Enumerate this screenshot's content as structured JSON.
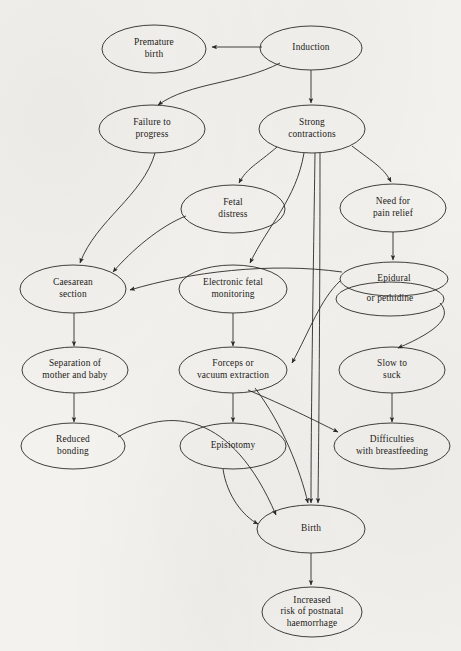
{
  "diagram": {
    "background_color": "#f4f2ee",
    "stroke_color": "#2b2a28",
    "text_color": "#1d1c1a",
    "nodes": [
      {
        "id": "premature_birth",
        "lines": [
          "Premature",
          "birth"
        ],
        "cx": 154,
        "cy": 49,
        "rx": 52,
        "ry": 24
      },
      {
        "id": "induction",
        "lines": [
          "Induction"
        ],
        "cx": 311,
        "cy": 48,
        "rx": 51,
        "ry": 22
      },
      {
        "id": "failure_to_progress",
        "lines": [
          "Failure to",
          "progress"
        ],
        "cx": 152,
        "cy": 129,
        "rx": 53,
        "ry": 24
      },
      {
        "id": "strong_contractions",
        "lines": [
          "Strong",
          "contractions"
        ],
        "cx": 312,
        "cy": 129,
        "rx": 53,
        "ry": 24
      },
      {
        "id": "fetal_distress",
        "lines": [
          "Fetal",
          "distress"
        ],
        "cx": 233,
        "cy": 209,
        "rx": 52,
        "ry": 24
      },
      {
        "id": "need_for_pain_relief",
        "lines": [
          "Need for",
          "pain relief"
        ],
        "cx": 393,
        "cy": 208,
        "rx": 53,
        "ry": 24
      },
      {
        "id": "caesarean_section",
        "lines": [
          "Caesarean",
          "section"
        ],
        "cx": 73,
        "cy": 289,
        "rx": 53,
        "ry": 24
      },
      {
        "id": "electronic_fetal_mon",
        "lines": [
          "Electronic fetal",
          "monitoring"
        ],
        "cx": 233,
        "cy": 289,
        "rx": 54,
        "ry": 24
      },
      {
        "id": "epidural",
        "lines": [
          "Epidural"
        ],
        "cx": 394,
        "cy": 279,
        "rx": 54,
        "ry": 17
      },
      {
        "id": "or_pethidine",
        "lines": [
          "or pethidine"
        ],
        "cx": 390,
        "cy": 299,
        "rx": 54,
        "ry": 17
      },
      {
        "id": "separation_mother_baby",
        "lines": [
          "Separation of",
          "mother and baby"
        ],
        "cx": 75,
        "cy": 370,
        "rx": 53,
        "ry": 23
      },
      {
        "id": "forceps_vacuum",
        "lines": [
          "Forceps or",
          "vacuum extraction"
        ],
        "cx": 233,
        "cy": 370,
        "rx": 54,
        "ry": 23
      },
      {
        "id": "slow_to_suck",
        "lines": [
          "Slow to",
          "suck"
        ],
        "cx": 392,
        "cy": 370,
        "rx": 53,
        "ry": 23
      },
      {
        "id": "reduced_bonding",
        "lines": [
          "Reduced",
          "bonding"
        ],
        "cx": 73,
        "cy": 446,
        "rx": 52,
        "ry": 23
      },
      {
        "id": "episiotomy",
        "lines": [
          "Episiotomy"
        ],
        "cx": 233,
        "cy": 446,
        "rx": 53,
        "ry": 23
      },
      {
        "id": "difficulties_breastfeed",
        "lines": [
          "Difficulties",
          "with breastfeeding"
        ],
        "cx": 392,
        "cy": 446,
        "rx": 58,
        "ry": 23
      },
      {
        "id": "birth",
        "lines": [
          "Birth"
        ],
        "cx": 311,
        "cy": 529,
        "rx": 54,
        "ry": 24
      },
      {
        "id": "postnatal_haemorrhage",
        "lines": [
          "Increased",
          "risk of postnatal",
          "haemorrhage"
        ],
        "cx": 312,
        "cy": 612,
        "rx": 50,
        "ry": 25
      }
    ],
    "edges": [
      {
        "from": "induction",
        "to": "premature_birth",
        "path": "M 262 47 L 212 47"
      },
      {
        "from": "induction",
        "to": "failure_to_progress",
        "path": "M 280 63 C 240 84 190 82 158 105"
      },
      {
        "from": "induction",
        "to": "strong_contractions",
        "path": "M 311 70 L 311 103"
      },
      {
        "from": "failure_to_progress",
        "to": "caesarean_section",
        "path": "M 155 153 C 143 196 96 220 80 263"
      },
      {
        "from": "strong_contractions",
        "to": "fetal_distress",
        "path": "M 277 147 C 256 165 247 168 239 183"
      },
      {
        "from": "strong_contractions",
        "to": "need_for_pain_relief",
        "path": "M 352 146 C 374 163 384 168 391 182"
      },
      {
        "from": "strong_contractions",
        "to": "electronic_fetal_mon",
        "path": "M 304 153 C 296 200 268 225 250 263"
      },
      {
        "from": "strong_contractions",
        "to": "birth",
        "path": "M 315 153 C 313 290 311 420 311 503"
      },
      {
        "from": "strong_contractions",
        "to": "birth_b",
        "path": "M 320 153 C 320 290 319 420 318 503"
      },
      {
        "from": "fetal_distress",
        "to": "caesarean_section",
        "path": "M 186 216 C 160 226 131 251 113 272"
      },
      {
        "from": "need_for_pain_relief",
        "to": "epidural",
        "path": "M 393 232 L 393 260"
      },
      {
        "from": "epidural",
        "to": "caesarean_section",
        "path": "M 342 272 C 270 262 190 272 130 290"
      },
      {
        "from": "epidural",
        "to": "forceps_vacuum",
        "path": "M 340 281 C 320 300 310 330 292 363"
      },
      {
        "from": "or_pethidine",
        "to": "slow_to_suck",
        "path": "M 440 303 C 452 316 440 330 398 348"
      },
      {
        "from": "caesarean_section",
        "to": "separation_mother_baby",
        "path": "M 74 313 L 74 346"
      },
      {
        "from": "electronic_fetal_mon",
        "to": "forceps_vacuum",
        "path": "M 233 313 L 233 346"
      },
      {
        "from": "separation_mother_baby",
        "to": "reduced_bonding",
        "path": "M 74 393 L 74 422"
      },
      {
        "from": "forceps_vacuum",
        "to": "episiotomy",
        "path": "M 233 393 L 233 422"
      },
      {
        "from": "forceps_vacuum",
        "to": "difficulties_breastfeed",
        "path": "M 248 390 C 286 406 314 420 338 432"
      },
      {
        "from": "forceps_vacuum",
        "to": "birth",
        "path": "M 255 388 C 283 425 300 470 308 503"
      },
      {
        "from": "slow_to_suck",
        "to": "difficulties_breastfeed",
        "path": "M 392 393 L 392 422"
      },
      {
        "from": "reduced_bonding",
        "to": "birth",
        "path": "M 118 437 C 170 406 232 412 276 515"
      },
      {
        "from": "episiotomy",
        "to": "birth",
        "path": "M 223 469 C 227 496 243 516 258 524"
      },
      {
        "from": "birth",
        "to": "postnatal_haemorrhage",
        "path": "M 311 553 L 311 585"
      }
    ]
  }
}
